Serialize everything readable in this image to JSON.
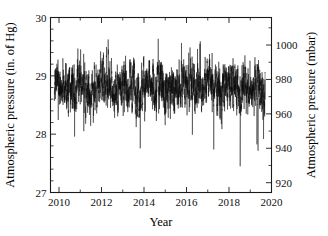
{
  "chart_data": {
    "type": "line",
    "title": "",
    "subtitle": "",
    "xlabel": "Year",
    "ylabel": "Atmospheric pressure (in. of Hg)",
    "ylabel_right": "Atmospheric pressure (mbar)",
    "xlim": [
      2009.6,
      2020.0
    ],
    "ylim": [
      27,
      30
    ],
    "ylim_right": [
      914.3,
      1016.0
    ],
    "grid": false,
    "legend": null,
    "legend_position": "none",
    "x_ticks_major": [
      2010,
      2012,
      2014,
      2016,
      2018,
      2020
    ],
    "x_ticklabels": [
      "2010",
      "2012",
      "2014",
      "2016",
      "2018",
      "2020"
    ],
    "x_ticks_minor": [
      2011,
      2013,
      2015,
      2017,
      2019
    ],
    "y_ticks_major": [
      27,
      28,
      29,
      30
    ],
    "y_ticklabels": [
      "27",
      "28",
      "29",
      "30"
    ],
    "y_ticks_minor": [
      27.2,
      27.4,
      27.6,
      27.8,
      28.2,
      28.4,
      28.6,
      28.8,
      29.2,
      29.4,
      29.6,
      29.8
    ],
    "y_right_ticks_major": [
      920,
      940,
      960,
      980,
      1000
    ],
    "y_right_ticklabels": [
      "920",
      "940",
      "960",
      "980",
      "1000"
    ],
    "y_right_ticks_minor": [
      930,
      950,
      970,
      990,
      1010
    ],
    "series_name": "Atmospheric pressure",
    "series_color": "#0b0b0b",
    "data_start_x": 2009.78,
    "data_end_x": 2019.7,
    "data_mean": 28.82,
    "data_typical_min": 28.45,
    "data_typical_max": 29.2,
    "data_extreme_min": 27.45,
    "data_extreme_max": 29.62
  }
}
